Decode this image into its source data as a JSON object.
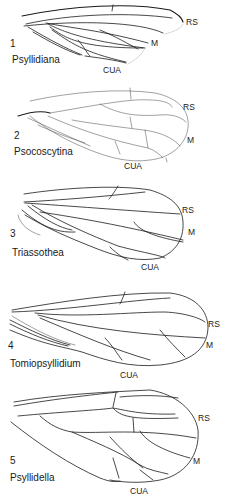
{
  "figure": {
    "panels": [
      {
        "number": "1",
        "taxon": "Psyllidiana",
        "vein_labels": [
          "RS",
          "M",
          "CUA"
        ]
      },
      {
        "number": "2",
        "taxon": "Psocoscytina",
        "vein_labels": [
          "RS",
          "M",
          "CUA"
        ]
      },
      {
        "number": "3",
        "taxon": "Triassothea",
        "vein_labels": [
          "RS",
          "M",
          "CUA"
        ]
      },
      {
        "number": "4",
        "taxon": "Tomiopsyllidium",
        "vein_labels": [
          "RS",
          "M",
          "CUA"
        ]
      },
      {
        "number": "5",
        "taxon": "Psyllidella",
        "vein_labels": [
          "RS",
          "M",
          "CUA"
        ]
      }
    ],
    "colors": {
      "line": "#1a1a1a",
      "background": "#ffffff"
    }
  }
}
